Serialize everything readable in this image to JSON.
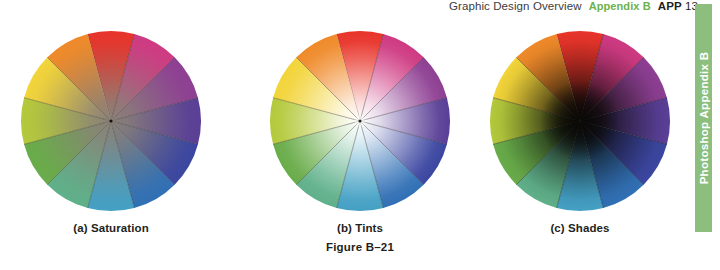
{
  "header": {
    "chapter": "Graphic Design Overview",
    "appendix": "Appendix B",
    "page_prefix": "APP",
    "page_number": "13",
    "appendix_color": "#6cb24d"
  },
  "side_tab": {
    "label": "Photoshop Appendix B",
    "background": "#8cbe7e",
    "text_color": "#ffffff"
  },
  "figure": {
    "number": "Figure B–21",
    "wheels": [
      {
        "id": "saturation",
        "caption": "(a) Saturation",
        "center_mode": "desaturated-gray",
        "center_color": "#8a8178"
      },
      {
        "id": "tints",
        "caption": "(b) Tints",
        "center_mode": "white",
        "center_color": "#ffffff"
      },
      {
        "id": "shades",
        "caption": "(c) Shades",
        "center_mode": "black",
        "center_color": "#0a0806"
      }
    ],
    "segment_count": 12,
    "hues": [
      {
        "name": "red",
        "hex": "#e8342a"
      },
      {
        "name": "magenta",
        "hex": "#cf3a82"
      },
      {
        "name": "purple",
        "hex": "#8e3f93"
      },
      {
        "name": "violet",
        "hex": "#5a3f96"
      },
      {
        "name": "blue-violet",
        "hex": "#3b46a0"
      },
      {
        "name": "blue",
        "hex": "#3170b5"
      },
      {
        "name": "cyan-blue",
        "hex": "#44a0c4"
      },
      {
        "name": "green-cyan",
        "hex": "#5fb08a"
      },
      {
        "name": "green",
        "hex": "#69ac4a"
      },
      {
        "name": "yellow-green",
        "hex": "#b4c93c"
      },
      {
        "name": "yellow",
        "hex": "#f2d43a"
      },
      {
        "name": "orange",
        "hex": "#ef8a2a"
      },
      {
        "name": "red-orange",
        "hex": "#ea5426"
      }
    ]
  }
}
